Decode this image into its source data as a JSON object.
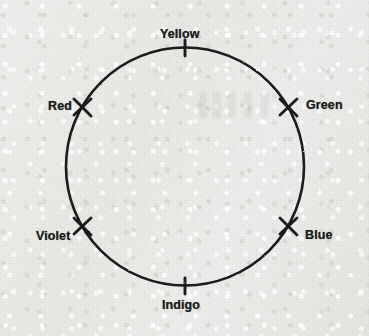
{
  "figure": {
    "shape": "circle",
    "stroke_color": "#1a1a1a",
    "background_color": "#e9e9e7",
    "circle": {
      "cx": 185,
      "cy": 166.5,
      "r": 119,
      "stroke_width": 2.6
    }
  },
  "labels": [
    {
      "id": "yellow",
      "text": "Yellow",
      "angle_deg": 90,
      "tick_style": "vertical-bar"
    },
    {
      "id": "green",
      "text": "Green",
      "angle_deg": 30,
      "tick_style": "cross"
    },
    {
      "id": "red",
      "text": "Red",
      "angle_deg": 150,
      "tick_style": "cross"
    },
    {
      "id": "violet",
      "text": "Violet",
      "angle_deg": 210,
      "tick_style": "cross"
    },
    {
      "id": "blue",
      "text": "Blue",
      "angle_deg": 330,
      "tick_style": "cross"
    },
    {
      "id": "indigo",
      "text": "Indigo",
      "angle_deg": 270,
      "tick_style": "vertical-bar"
    }
  ],
  "ticks": [
    {
      "id": "tick-yellow",
      "x": 185,
      "y": 47.5,
      "kind": "vertical-bar"
    },
    {
      "id": "tick-green",
      "x": 288,
      "y": 107,
      "kind": "cross"
    },
    {
      "id": "tick-red",
      "x": 82,
      "y": 107,
      "kind": "cross"
    },
    {
      "id": "tick-violet",
      "x": 82,
      "y": 226,
      "kind": "cross"
    },
    {
      "id": "tick-blue",
      "x": 288,
      "y": 226,
      "kind": "cross"
    },
    {
      "id": "tick-indigo",
      "x": 185,
      "y": 285.5,
      "kind": "vertical-bar"
    }
  ]
}
